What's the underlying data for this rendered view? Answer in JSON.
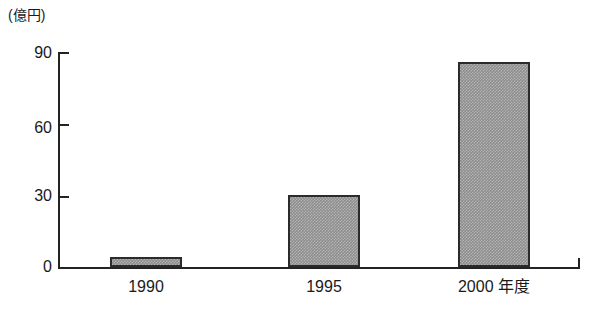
{
  "figure": {
    "unit_label": "(億円)",
    "background_color": "#ffffff",
    "ink_color": "#232323",
    "bar_fill_color": "#8d8d8d",
    "bar_edge_color": "#2b2b2b"
  },
  "chart_data": {
    "type": "bar",
    "title": "",
    "subtitle": "",
    "xlabel": "",
    "ylabel": "(億円)",
    "categories": [
      "1990",
      "1995",
      "2000 年度"
    ],
    "values": [
      4,
      30,
      86
    ],
    "series": [
      {
        "name": "",
        "values": [
          4,
          30,
          86
        ]
      }
    ],
    "ylim": [
      0,
      90
    ],
    "yticks": [
      0,
      30,
      60,
      90
    ],
    "ytick_labels": [
      "0",
      "30",
      "60",
      "90"
    ],
    "grid": false,
    "legend": false,
    "legend_position": "none",
    "annotations": []
  },
  "axis": {
    "y_tick_0": "0",
    "y_tick_1": "30",
    "y_tick_2": "60",
    "y_tick_3": "90",
    "x_cat_0": "1990",
    "x_cat_1": "1995",
    "x_cat_2": "2000 年度"
  }
}
